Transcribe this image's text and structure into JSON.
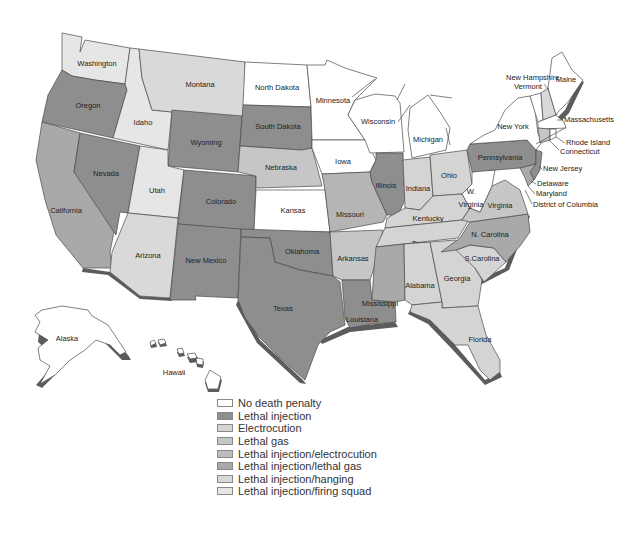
{
  "legend": {
    "items": [
      {
        "key": "none",
        "label": "No death penalty",
        "color": "#ffffff"
      },
      {
        "key": "li",
        "label": "Lethal injection",
        "color": "#8e8e8e"
      },
      {
        "key": "el",
        "label": "Electrocution",
        "color": "#d4d4d4"
      },
      {
        "key": "gas",
        "label": "Lethal gas",
        "color": "#c6c6c6"
      },
      {
        "key": "li_el",
        "label": "Lethal injection/electrocution",
        "color": "#bdbdbd"
      },
      {
        "key": "li_gas",
        "label": "Lethal injection/lethal gas",
        "color": "#a9a9a9"
      },
      {
        "key": "li_hang",
        "label": "Lethal injection/hanging",
        "color": "#d9d9d9"
      },
      {
        "key": "li_fire",
        "label": "Lethal injection/firing squad",
        "color": "#e6e6e6"
      }
    ]
  },
  "states": {
    "washington": "Washington",
    "oregon": "Oregon",
    "california": "California",
    "nevada": "Nevada",
    "idaho": "Idaho",
    "montana": "Montana",
    "wyoming": "Wyoming",
    "utah": "Utah",
    "colorado": "Colorado",
    "arizona": "Arizona",
    "new_mexico": "New Mexico",
    "north_dakota": "North Dakota",
    "south_dakota": "South Dakota",
    "nebraska": "Nebraska",
    "kansas": "Kansas",
    "oklahoma": "Oklahoma",
    "texas": "Texas",
    "minnesota": "Minnesota",
    "iowa": "Iowa",
    "missouri": "Missouri",
    "arkansas": "Arkansas",
    "louisiana": "Louisiana",
    "wisconsin": "Wisconsin",
    "illinois": "Illinois",
    "michigan": "Michigan",
    "indiana": "Indiana",
    "ohio": "Ohio",
    "kentucky": "Kentucky",
    "tennessee": "Tennessee",
    "mississippi": "Mississippi",
    "alabama": "Alabama",
    "georgia": "Georgia",
    "florida": "Florida",
    "south_carolina": "S.Carolina",
    "north_carolina": "N. Carolina",
    "virginia": "Virginia",
    "west_virginia_1": "W.",
    "west_virginia_2": "Virginia",
    "pennsylvania": "Pennsylvania",
    "new_york": "New York",
    "maine": "Maine",
    "new_hampshire": "New Hampshire",
    "vermont": "Vermont",
    "massachusetts": "Massachusetts",
    "rhode_island": "Rhode Island",
    "connecticut": "Connecticut",
    "new_jersey": "New Jersey",
    "delaware": "Delaware",
    "maryland": "Maryland",
    "dc": "District of Columbia",
    "alaska": "Alaska",
    "hawaii": "Hawaii"
  }
}
